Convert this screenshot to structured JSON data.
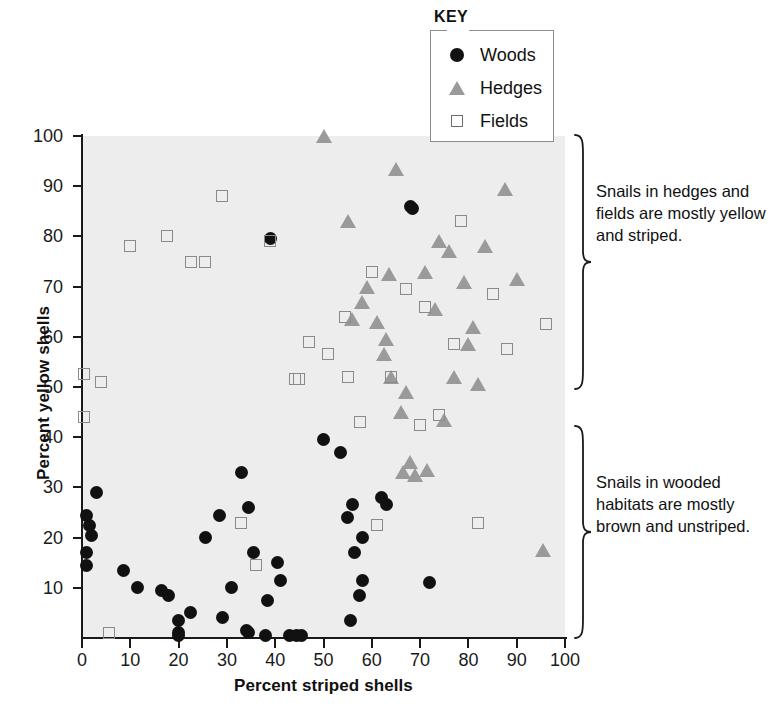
{
  "chart_data": {
    "type": "scatter",
    "title": "",
    "xlabel": "Percent striped shells",
    "ylabel": "Percent yellow shells",
    "xlim": [
      0,
      100
    ],
    "ylim": [
      0,
      100
    ],
    "xticks": [
      0,
      10,
      20,
      30,
      40,
      50,
      60,
      70,
      80,
      90,
      100
    ],
    "yticks": [
      10,
      20,
      30,
      40,
      50,
      60,
      70,
      80,
      90,
      100
    ],
    "grid": false,
    "legend_position": "top-center",
    "legend_title": "KEY",
    "series": [
      {
        "name": "Woods",
        "marker": "filled-circle",
        "color": "#111111",
        "points": [
          [
            1,
            24.5
          ],
          [
            1.5,
            22.5
          ],
          [
            1,
            14.5
          ],
          [
            1,
            17
          ],
          [
            2,
            20.5
          ],
          [
            3,
            29
          ],
          [
            8.5,
            13.5
          ],
          [
            11.5,
            10
          ],
          [
            16.5,
            9.5
          ],
          [
            18,
            8.5
          ],
          [
            20,
            3.5
          ],
          [
            20,
            1
          ],
          [
            20,
            0.5
          ],
          [
            22.5,
            5
          ],
          [
            25.5,
            20
          ],
          [
            28.5,
            24.5
          ],
          [
            29,
            4
          ],
          [
            31,
            10
          ],
          [
            33,
            33
          ],
          [
            34,
            1.5
          ],
          [
            34.5,
            1
          ],
          [
            34.5,
            26
          ],
          [
            35.5,
            17
          ],
          [
            38,
            0.5
          ],
          [
            38.5,
            7.5
          ],
          [
            39,
            79.5
          ],
          [
            40.5,
            15
          ],
          [
            41,
            11.5
          ],
          [
            43,
            0.5
          ],
          [
            44.5,
            0.5
          ],
          [
            45.5,
            0.5
          ],
          [
            50,
            39.5
          ],
          [
            53.5,
            37
          ],
          [
            55,
            24
          ],
          [
            55.5,
            3.5
          ],
          [
            56,
            26.5
          ],
          [
            56.5,
            17
          ],
          [
            57.5,
            8.5
          ],
          [
            58,
            11.5
          ],
          [
            58,
            20
          ],
          [
            62,
            28
          ],
          [
            63,
            26.5
          ],
          [
            68,
            86
          ],
          [
            68.5,
            85.5
          ],
          [
            72,
            11
          ]
        ]
      },
      {
        "name": "Hedges",
        "marker": "triangle",
        "color": "#9a9a9a",
        "points": [
          [
            50,
            100
          ],
          [
            55,
            83
          ],
          [
            56,
            63.5
          ],
          [
            58,
            67
          ],
          [
            59,
            70
          ],
          [
            61,
            63
          ],
          [
            62.5,
            56.5
          ],
          [
            63,
            59.5
          ],
          [
            63.5,
            72.5
          ],
          [
            64,
            52
          ],
          [
            65,
            93.5
          ],
          [
            66,
            45
          ],
          [
            66.5,
            33
          ],
          [
            67,
            49
          ],
          [
            68,
            35
          ],
          [
            69,
            32.5
          ],
          [
            71,
            73
          ],
          [
            71.5,
            33.5
          ],
          [
            73,
            65.5
          ],
          [
            74,
            79
          ],
          [
            75,
            43.5
          ],
          [
            76,
            77
          ],
          [
            77,
            52
          ],
          [
            79,
            71
          ],
          [
            80,
            58.5
          ],
          [
            81,
            62
          ],
          [
            82,
            50.5
          ],
          [
            83.5,
            78
          ],
          [
            87.5,
            89.5
          ],
          [
            90,
            71.5
          ],
          [
            95.5,
            17.5
          ]
        ]
      },
      {
        "name": "Fields",
        "marker": "open-square",
        "color": "#8a8a8a",
        "points": [
          [
            0.5,
            52.5
          ],
          [
            0.5,
            44
          ],
          [
            4,
            51
          ],
          [
            5.5,
            1
          ],
          [
            10,
            78
          ],
          [
            17.5,
            80
          ],
          [
            22.5,
            75
          ],
          [
            25.5,
            75
          ],
          [
            29,
            88
          ],
          [
            33,
            23
          ],
          [
            36,
            14.5
          ],
          [
            39,
            79
          ],
          [
            44,
            51.5
          ],
          [
            45,
            51.5
          ],
          [
            47,
            59
          ],
          [
            51,
            56.5
          ],
          [
            54.5,
            64
          ],
          [
            55,
            52
          ],
          [
            57.5,
            43
          ],
          [
            60,
            73
          ],
          [
            61,
            22.5
          ],
          [
            64,
            52
          ],
          [
            67,
            69.5
          ],
          [
            70,
            42.5
          ],
          [
            71,
            66
          ],
          [
            74,
            44.5
          ],
          [
            77,
            58.5
          ],
          [
            78.5,
            83
          ],
          [
            82,
            23
          ],
          [
            85,
            68.5
          ],
          [
            88,
            57.5
          ],
          [
            96,
            62.5
          ]
        ]
      }
    ],
    "annotations": [
      {
        "id": "annotation-top",
        "text": "Snails in hedges and fields are mostly yellow and striped.",
        "brace_span_percent_y": [
          44,
          100
        ]
      },
      {
        "id": "annotation-bottom",
        "text": "Snails in wooded habitats are mostly brown and unstriped.",
        "brace_span_percent_y": [
          0,
          42
        ]
      }
    ]
  },
  "axes": {
    "x_title": "Percent striped shells",
    "y_title": "Percent yellow shells",
    "x_ticks": [
      "0",
      "10",
      "20",
      "30",
      "40",
      "50",
      "60",
      "70",
      "80",
      "90",
      "100"
    ],
    "y_ticks": [
      "10",
      "20",
      "30",
      "40",
      "50",
      "60",
      "70",
      "80",
      "90",
      "100"
    ]
  },
  "legend": {
    "title": "KEY",
    "items": [
      {
        "label": "Woods",
        "icon": "filled-circle-icon"
      },
      {
        "label": "Hedges",
        "icon": "gray-triangle-icon"
      },
      {
        "label": "Fields",
        "icon": "open-square-icon"
      }
    ]
  },
  "annotations": {
    "top": "Snails in hedges and fields are mostly yellow and striped.",
    "bottom": "Snails in wooded habitats are mostly brown and unstriped."
  },
  "colors": {
    "woods": "#111111",
    "hedges": "#9a9a9a",
    "fields": "#8a8a8a",
    "plot_background": "#ededed",
    "axis": "#1a1a1a"
  }
}
